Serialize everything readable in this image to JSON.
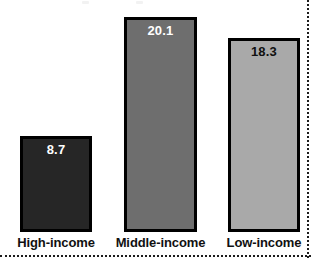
{
  "chart_data": {
    "type": "bar",
    "title": "",
    "xlabel": "",
    "ylabel": "",
    "categories": [
      "High-income",
      "Middle-income",
      "Low-income"
    ],
    "values": [
      8.7,
      20.1,
      18.3
    ],
    "value_labels": [
      "8.7",
      "20.1",
      "18.3"
    ],
    "ylim": [
      0,
      22.5
    ],
    "grid": false,
    "legend": "none",
    "axes_visible": false,
    "bar_colors": [
      "#262626",
      "#6e6e6e",
      "#a9a9a9"
    ],
    "bar_border_color": "#000000",
    "value_label_colors": [
      "#ffffff",
      "#ffffff",
      "#101010"
    ],
    "background": "#ffffff",
    "frame": {
      "right_edge_style": "dotted",
      "bottom_edge_style": "dotted",
      "edge_color": "#1c1c1c"
    }
  },
  "bars": [
    {
      "category": "High-income",
      "value_label": "8.7",
      "fill": "#262626",
      "label_tone": "light",
      "left_px": 20,
      "width_px": 72,
      "height_px": 96
    },
    {
      "category": "Middle-income",
      "value_label": "20.1",
      "fill": "#6e6e6e",
      "label_tone": "light",
      "left_px": 124,
      "width_px": 73,
      "height_px": 215
    },
    {
      "category": "Low-income",
      "value_label": "18.3",
      "fill": "#a9a9a9",
      "label_tone": "dark",
      "left_px": 228,
      "width_px": 72,
      "height_px": 194
    }
  ]
}
